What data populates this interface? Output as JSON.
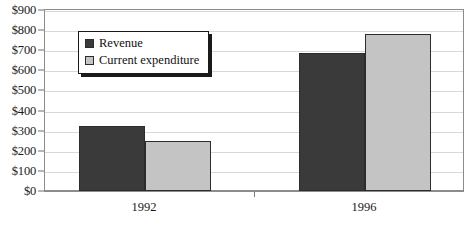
{
  "chart_data": {
    "type": "bar",
    "title": "",
    "xlabel": "",
    "ylabel": "",
    "categories": [
      "1992",
      "1996"
    ],
    "series": [
      {
        "name": "Revenue",
        "values": [
          325,
          685
        ],
        "color": "#3a3a3a"
      },
      {
        "name": "Current expenditure",
        "values": [
          250,
          780
        ],
        "color": "#c4c4c4"
      }
    ],
    "ylim": [
      0,
      900
    ],
    "ytick_step": 100,
    "ytick_labels": [
      "$0",
      "$100",
      "$200",
      "$300",
      "$400",
      "$500",
      "$600",
      "$700",
      "$800",
      "$900"
    ],
    "ytick_values": [
      0,
      100,
      200,
      300,
      400,
      500,
      600,
      700,
      800,
      900
    ],
    "grid": true,
    "legend_position": "top-left-inside",
    "value_prefix": "$"
  },
  "legend": {
    "items": [
      {
        "label": "Revenue",
        "color": "#3a3a3a"
      },
      {
        "label": "Current expenditure",
        "color": "#c4c4c4"
      }
    ]
  }
}
